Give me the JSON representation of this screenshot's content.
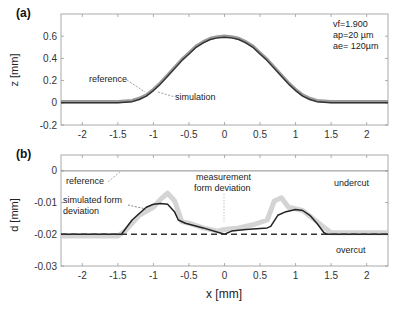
{
  "chart_data": [
    {
      "id": "a",
      "panel_label": "(a)",
      "type": "line",
      "title": "",
      "xlabel": "",
      "ylabel": "z [mm]",
      "xlim": [
        -2.3,
        2.3
      ],
      "ylim": [
        -0.2,
        0.8
      ],
      "grid": false,
      "xticks": [
        -2,
        -1.5,
        -1,
        -0.5,
        0,
        0.5,
        1,
        1.5,
        2
      ],
      "xtick_labels": [
        "-2",
        "-1.5",
        "-1",
        "-0.5",
        "0",
        "0.5",
        "1",
        "1.5",
        "2"
      ],
      "yticks": [
        -0.2,
        0,
        0.2,
        0.4,
        0.6
      ],
      "ytick_labels": [
        "-0.2",
        "0",
        "0.2",
        "0.4",
        "0.6"
      ],
      "parameters": [
        "vf=1.900",
        "ap=20 µm",
        "ae= 120µm"
      ],
      "series": [
        {
          "name": "reference",
          "color": "#9a9a9a",
          "x": [
            -2.3,
            -1.5,
            -1.3,
            -1.2,
            -1.1,
            -1.0,
            -0.9,
            -0.8,
            -0.7,
            -0.6,
            -0.5,
            -0.4,
            -0.3,
            -0.2,
            -0.1,
            0,
            0.1,
            0.2,
            0.3,
            0.4,
            0.5,
            0.6,
            0.7,
            0.8,
            0.9,
            1.0,
            1.1,
            1.2,
            1.3,
            1.5,
            2.3
          ],
          "y": [
            0.01,
            0.01,
            0.02,
            0.04,
            0.07,
            0.12,
            0.18,
            0.25,
            0.32,
            0.39,
            0.45,
            0.51,
            0.55,
            0.58,
            0.595,
            0.6,
            0.595,
            0.58,
            0.55,
            0.51,
            0.45,
            0.39,
            0.32,
            0.25,
            0.18,
            0.12,
            0.07,
            0.04,
            0.02,
            0.01,
            0.01
          ]
        },
        {
          "name": "simulation",
          "color": "#333333",
          "x": [
            -2.3,
            -1.5,
            -1.3,
            -1.2,
            -1.1,
            -1.0,
            -0.9,
            -0.8,
            -0.7,
            -0.6,
            -0.5,
            -0.4,
            -0.3,
            -0.2,
            -0.1,
            0,
            0.1,
            0.2,
            0.3,
            0.4,
            0.5,
            0.6,
            0.7,
            0.8,
            0.9,
            1.0,
            1.1,
            1.2,
            1.3,
            1.5,
            2.3
          ],
          "y": [
            0.0,
            0.0,
            0.01,
            0.03,
            0.06,
            0.11,
            0.17,
            0.24,
            0.31,
            0.38,
            0.44,
            0.5,
            0.54,
            0.57,
            0.585,
            0.59,
            0.585,
            0.57,
            0.54,
            0.5,
            0.44,
            0.38,
            0.31,
            0.24,
            0.17,
            0.11,
            0.06,
            0.03,
            0.01,
            0.0,
            0.0
          ]
        }
      ],
      "annotations": [
        {
          "text": "reference",
          "x": -1.85,
          "y": 0.215
        },
        {
          "text": "simulation",
          "x": -0.45,
          "y": 0.12
        }
      ]
    },
    {
      "id": "b",
      "panel_label": "(b)",
      "type": "line",
      "title": "",
      "xlabel": "x [mm]",
      "ylabel": "d [mm]",
      "xlim": [
        -2.3,
        2.3
      ],
      "ylim": [
        -0.03,
        0.005
      ],
      "grid": false,
      "xticks": [
        -2,
        -1.5,
        -1,
        -0.5,
        0,
        0.5,
        1,
        1.5,
        2
      ],
      "xtick_labels": [
        "-2",
        "-1.5",
        "-1",
        "-0.5",
        "0",
        "0.5",
        "1",
        "1.5",
        "2"
      ],
      "yticks": [
        -0.03,
        -0.02,
        -0.01,
        0
      ],
      "ytick_labels": [
        "-0.03",
        "-0.02",
        "-0.01",
        "0"
      ],
      "series": [
        {
          "name": "reference",
          "style": "solid",
          "color": "#8c8c8c",
          "x": [
            -2.3,
            2.3
          ],
          "y": [
            0,
            0
          ]
        },
        {
          "name": "measurement form deviation",
          "style": "band",
          "color": "#cfcfcf",
          "x": [
            -2.3,
            -1.5,
            -1.4,
            -1.2,
            -1.0,
            -0.9,
            -0.8,
            -0.7,
            -0.6,
            -0.5,
            -0.3,
            -0.1,
            0,
            0.2,
            0.4,
            0.6,
            0.7,
            0.8,
            0.9,
            1.1,
            1.3,
            1.5,
            2.3
          ],
          "y": [
            -0.0205,
            -0.0205,
            -0.019,
            -0.014,
            -0.0115,
            -0.009,
            -0.007,
            -0.0095,
            -0.016,
            -0.0165,
            -0.018,
            -0.019,
            -0.0185,
            -0.018,
            -0.017,
            -0.0155,
            -0.0095,
            -0.0085,
            -0.0115,
            -0.0125,
            -0.016,
            -0.0195,
            -0.0195
          ]
        },
        {
          "name": "simulated form deviation",
          "style": "solid",
          "color": "#222222",
          "x": [
            -2.3,
            -1.45,
            -1.3,
            -1.1,
            -1.0,
            -0.9,
            -0.8,
            -0.7,
            -0.65,
            -0.55,
            -0.3,
            0,
            0.1,
            0.3,
            0.6,
            0.65,
            0.75,
            0.85,
            1.0,
            1.1,
            1.2,
            1.3,
            1.4,
            1.45,
            2.3
          ],
          "y": [
            -0.02,
            -0.02,
            -0.0155,
            -0.0115,
            -0.0105,
            -0.0103,
            -0.0105,
            -0.013,
            -0.0155,
            -0.0165,
            -0.018,
            -0.02,
            -0.019,
            -0.0185,
            -0.018,
            -0.0175,
            -0.014,
            -0.013,
            -0.0122,
            -0.0125,
            -0.014,
            -0.0165,
            -0.0195,
            -0.02,
            -0.02
          ]
        },
        {
          "name": "nominal",
          "style": "dashed",
          "color": "#333333",
          "x": [
            -2.3,
            2.3
          ],
          "y": [
            -0.02,
            -0.02
          ]
        }
      ],
      "annotations": [
        {
          "text": "reference",
          "x": -2.1,
          "y": -0.0035
        },
        {
          "text": "simulated form",
          "x": -2.2,
          "y": -0.0085
        },
        {
          "text": "deviation",
          "x": -2.2,
          "y": -0.0115
        },
        {
          "text": "measurement",
          "x": -0.6,
          "y": -0.0028
        },
        {
          "text": "form deviation",
          "x": -0.6,
          "y": -0.0055
        },
        {
          "text": "undercut",
          "x": 1.5,
          "y": -0.0048
        },
        {
          "text": "overcut",
          "x": 1.55,
          "y": -0.0255
        }
      ]
    }
  ]
}
